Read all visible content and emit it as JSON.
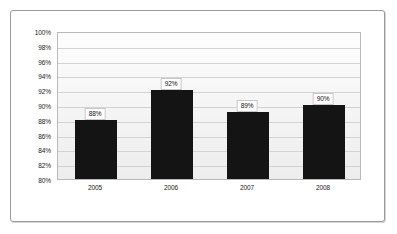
{
  "chart_data": {
    "type": "bar",
    "title": "",
    "subtitle": "",
    "xlabel": "",
    "ylabel": "",
    "categories": [
      "2005",
      "2006",
      "2007",
      "2008"
    ],
    "values": [
      88,
      92,
      89,
      90
    ],
    "data_labels": [
      "88%",
      "92%",
      "89%",
      "90%"
    ],
    "ylim": [
      80,
      100
    ],
    "ytick_step": 2,
    "ytick_labels": [
      "100%",
      "98%",
      "96%",
      "94%",
      "92%",
      "90%",
      "88%",
      "86%",
      "84%",
      "82%",
      "80%"
    ],
    "ytick_values": [
      100,
      98,
      96,
      94,
      92,
      90,
      88,
      86,
      84,
      82,
      80
    ],
    "grid": true,
    "legend": false,
    "legend_position": "none",
    "series": [
      {
        "name": "",
        "values": [
          88,
          92,
          89,
          90
        ],
        "color": "#141414"
      }
    ]
  },
  "style": {
    "bar_color": "#141414",
    "grid_color": "#d3d3d3",
    "plot_border_color": "#b9b9b9",
    "frame_border_color": "#9a9a9a",
    "label_box_background": "#ffffff",
    "label_box_border": "#c8c8c8",
    "text_color": "#1a1a1a"
  }
}
